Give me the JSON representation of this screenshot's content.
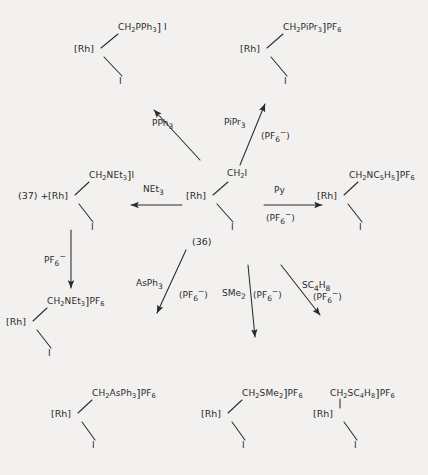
{
  "figure": {
    "type": "reaction-scheme",
    "title": "",
    "background_color": "#f2f1ef",
    "ink_color": "#2b2b2b",
    "center_compound_number": "(36)",
    "side_compound_number": "(37)"
  },
  "nodes": {
    "center": {
      "id": "center",
      "metal": "[Rh]",
      "top_group": "CH2I",
      "top_group_html": "CH<sub>2</sub>I",
      "bottom_group": "I",
      "counterion": "",
      "has_bracket": false,
      "number": "(36)"
    },
    "top_left": {
      "id": "top-left-product",
      "metal": "[Rh]",
      "top_group": "CH2PPh3",
      "top_group_html": "CH<sub>2</sub>PPh<sub>3</sub>",
      "bottom_group": "I",
      "counterion": "I",
      "has_bracket": true
    },
    "top_right": {
      "id": "top-right-product",
      "metal": "[Rh]",
      "top_group": "CH2PiPr3",
      "top_group_html": "CH<sub>2</sub>PiPr<sub>3</sub>",
      "bottom_group": "I",
      "counterion": "PF6",
      "counterion_html": "PF<sub>6</sub>",
      "has_bracket": true
    },
    "mid_left": {
      "id": "mid-left-product",
      "prefix": "(37) +",
      "metal": "[Rh]",
      "top_group": "CH2NEt3",
      "top_group_html": "CH<sub>2</sub>NEt<sub>3</sub>",
      "bottom_group": "I",
      "counterion": "I",
      "has_bracket": true
    },
    "mid_right": {
      "id": "mid-right-product",
      "metal": "[Rh]",
      "top_group": "CH2NC5H5",
      "top_group_html": "CH<sub>2</sub>NC<sub>5</sub>H<sub>5</sub>",
      "bottom_group": "I",
      "counterion": "PF6",
      "counterion_html": "PF<sub>6</sub>",
      "has_bracket": true
    },
    "lower_left": {
      "id": "lower-left-product",
      "metal": "[Rh]",
      "top_group": "CH2NEt3",
      "top_group_html": "CH<sub>2</sub>NEt<sub>3</sub>",
      "bottom_group": "I",
      "counterion": "PF6",
      "counterion_html": "PF<sub>6</sub>",
      "has_bracket": true
    },
    "bottom_left": {
      "id": "bottom-left-product",
      "metal": "[Rh]",
      "top_group": "CH2AsPh3",
      "top_group_html": "CH<sub>2</sub>AsPh<sub>3</sub>",
      "bottom_group": "I",
      "counterion": "PF6",
      "counterion_html": "PF<sub>6</sub>",
      "has_bracket": true
    },
    "bottom_center": {
      "id": "bottom-center-product",
      "metal": "[Rh]",
      "top_group": "CH2SMe2",
      "top_group_html": "CH<sub>2</sub>SMe<sub>2</sub>",
      "bottom_group": "I",
      "counterion": "PF6",
      "counterion_html": "PF<sub>6</sub>",
      "has_bracket": true
    },
    "bottom_right": {
      "id": "bottom-right-product",
      "metal": "[Rh]",
      "top_group": "CH2SC4H8",
      "top_group_html": "CH<sub>2</sub>SC<sub>4</sub>H<sub>8</sub>",
      "bottom_group": "I",
      "counterion": "PF6",
      "counterion_html": "PF<sub>6</sub>",
      "has_bracket": true
    }
  },
  "arrows": [
    {
      "id": "arrow-pph3",
      "from": "center",
      "to": "top_left",
      "direction": "up-left",
      "reagent": "PPh3",
      "reagent_html": "PPh<sub>3</sub>",
      "condition": "",
      "condition_html": ""
    },
    {
      "id": "arrow-pipr3",
      "from": "center",
      "to": "top_right",
      "direction": "up-right",
      "reagent": "PiPr3",
      "reagent_html": "PiPr<sub>3</sub>",
      "condition": "(PF6-)",
      "condition_html": "(PF<sub>6</sub><sup>&minus;</sup>)"
    },
    {
      "id": "arrow-net3",
      "from": "center",
      "to": "mid_left",
      "direction": "left",
      "reagent": "NEt3",
      "reagent_html": "NEt<sub>3</sub>",
      "condition": "",
      "condition_html": ""
    },
    {
      "id": "arrow-py",
      "from": "center",
      "to": "mid_right",
      "direction": "right",
      "reagent": "Py",
      "reagent_html": "Py",
      "condition": "(PF6-)",
      "condition_html": "(PF<sub>6</sub><sup>&minus;</sup>)"
    },
    {
      "id": "arrow-pf6",
      "from": "mid_left",
      "to": "lower_left",
      "direction": "down",
      "reagent": "PF6-",
      "reagent_html": "PF<sub>6</sub><sup>&minus;</sup>",
      "condition": "",
      "condition_html": ""
    },
    {
      "id": "arrow-asph3",
      "from": "center",
      "to": "bottom_left",
      "direction": "down-left",
      "reagent": "AsPh3",
      "reagent_html": "AsPh<sub>3</sub>",
      "condition": "(PF6-)",
      "condition_html": "(PF<sub>6</sub><sup>&minus;</sup>)"
    },
    {
      "id": "arrow-sme2",
      "from": "center",
      "to": "bottom_center",
      "direction": "down",
      "reagent": "SMe2",
      "reagent_html": "SMe<sub>2</sub>",
      "condition": "(PF6-)",
      "condition_html": "(PF<sub>6</sub><sup>&minus;</sup>)"
    },
    {
      "id": "arrow-sc4h8",
      "from": "center",
      "to": "bottom_right",
      "direction": "down-right",
      "reagent": "SC4H8",
      "reagent_html": "SC<sub>4</sub>H<sub>8</sub>",
      "condition": "(PF6-)",
      "condition_html": "(PF<sub>6</sub><sup>&minus;</sup>)"
    }
  ]
}
